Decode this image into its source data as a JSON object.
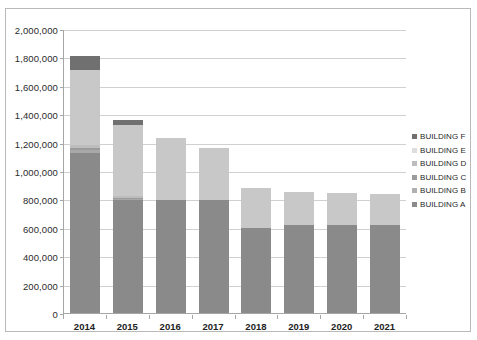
{
  "chart_data": {
    "type": "bar",
    "subtype": "stacked-bar",
    "title": "",
    "xlabel": "",
    "ylabel": "",
    "categories": [
      "2014",
      "2015",
      "2016",
      "2017",
      "2018",
      "2019",
      "2020",
      "2021"
    ],
    "ylim": [
      0,
      2000000
    ],
    "ytick_values": [
      0,
      200000,
      400000,
      600000,
      800000,
      1000000,
      1200000,
      1400000,
      1600000,
      1800000,
      2000000
    ],
    "ytick_labels": [
      "0",
      "200,000",
      "400,000",
      "600,000",
      "800,000",
      "1,000,000",
      "1,200,000",
      "1,400,000",
      "1,600,000",
      "1,800,000",
      "2,000,000"
    ],
    "grid": true,
    "grid_axis": "y",
    "legend_position": "right",
    "series": [
      {
        "name": "BUILDING A",
        "color": "#8a8a8a",
        "values": [
          1130000,
          795000,
          795000,
          795000,
          600000,
          620000,
          620000,
          620000
        ]
      },
      {
        "name": "BUILDING B",
        "color": "#a8a8a8",
        "values": [
          15000,
          8000,
          0,
          0,
          0,
          0,
          0,
          0
        ]
      },
      {
        "name": "BUILDING C",
        "color": "#9b9b9b",
        "values": [
          18000,
          10000,
          0,
          0,
          0,
          0,
          0,
          0
        ]
      },
      {
        "name": "BUILDING D",
        "color": "#bdbdbd",
        "values": [
          20000,
          12000,
          0,
          0,
          0,
          0,
          0,
          0
        ]
      },
      {
        "name": "BUILDING E",
        "color": "#c8c8c8",
        "values": [
          527000,
          500000,
          435000,
          370000,
          280000,
          230000,
          225000,
          220000
        ]
      },
      {
        "name": "BUILDING F",
        "color": "#707070",
        "values": [
          100000,
          35000,
          0,
          0,
          0,
          0,
          0,
          0
        ]
      }
    ],
    "totals": [
      1810000,
      1360000,
      1230000,
      1165000,
      880000,
      850000,
      845000,
      840000
    ]
  },
  "legend": {
    "items": [
      {
        "label": "BUILDING F",
        "color": "#707070"
      },
      {
        "label": "BUILDING E",
        "color": "#dedede"
      },
      {
        "label": "BUILDING D",
        "color": "#bdbdbd"
      },
      {
        "label": "BUILDING C",
        "color": "#9b9b9b"
      },
      {
        "label": "BUILDING B",
        "color": "#b0b0b0"
      },
      {
        "label": "BUILDING A",
        "color": "#8a8a8a"
      }
    ]
  }
}
